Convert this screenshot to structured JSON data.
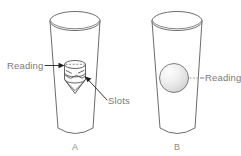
{
  "figure": {
    "type": "technical-line-diagram",
    "background_color": "#ffffff",
    "line_color": "#5b5b5b",
    "text_color": "#7a7a7a",
    "panels": [
      {
        "id": "A",
        "letter": "A",
        "float_type": "slotted-cylinder-float",
        "annotations": [
          {
            "name": "reading",
            "text": "Reading",
            "side": "left",
            "arrow": "solid-arrow-right"
          },
          {
            "name": "slots",
            "text": "Slots",
            "side": "right",
            "arrow": "solid-arrow-up-left"
          }
        ]
      },
      {
        "id": "B",
        "letter": "B",
        "float_type": "spherical-float",
        "annotations": [
          {
            "name": "reading",
            "text": "Reading",
            "side": "right",
            "arrow": "dashed-leader-left"
          }
        ]
      }
    ],
    "labels": {
      "reading_left": "Reading",
      "slots": "Slots",
      "reading_right": "Reading",
      "panel_a": "A",
      "panel_b": "B"
    }
  }
}
